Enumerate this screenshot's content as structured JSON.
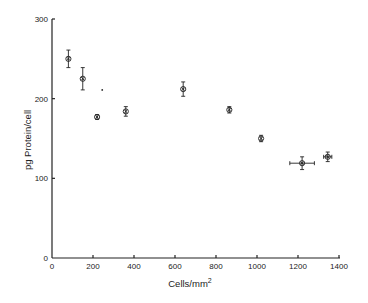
{
  "chart_data": {
    "type": "scatter",
    "title": "",
    "xlabel": "Cells/mm",
    "xlabel_superscript": "2",
    "ylabel": "pg Protein/cell",
    "xlim": [
      0,
      1400
    ],
    "ylim": [
      0,
      300
    ],
    "xticks": [
      0,
      200,
      400,
      600,
      800,
      1000,
      1200,
      1400
    ],
    "yticks": [
      0,
      100,
      200,
      300
    ],
    "grid": false,
    "legend": "none",
    "series": [
      {
        "name": "measurements",
        "marker": "circled-x",
        "points": [
          {
            "x": 80,
            "y": 250,
            "yerr": 11,
            "xerr": 0
          },
          {
            "x": 150,
            "y": 225,
            "yerr": 14,
            "xerr": 0
          },
          {
            "x": 220,
            "y": 177,
            "yerr": 3,
            "xerr": 0
          },
          {
            "x": 360,
            "y": 184,
            "yerr": 6,
            "xerr": 0
          },
          {
            "x": 640,
            "y": 212,
            "yerr": 9,
            "xerr": 0
          },
          {
            "x": 865,
            "y": 186,
            "yerr": 4,
            "xerr": 0
          },
          {
            "x": 1020,
            "y": 150,
            "yerr": 4,
            "xerr": 0
          },
          {
            "x": 1220,
            "y": 119,
            "yerr": 8,
            "xerr": 60
          },
          {
            "x": 1345,
            "y": 127,
            "yerr": 6,
            "xerr": 20
          }
        ]
      },
      {
        "name": "single-dot",
        "marker": "dot",
        "points": [
          {
            "x": 245,
            "y": 211
          }
        ]
      }
    ]
  }
}
